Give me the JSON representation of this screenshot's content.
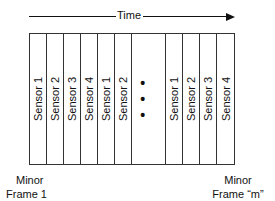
{
  "axis": {
    "label": "Time",
    "direction": "right"
  },
  "frame": {
    "columns": [
      {
        "type": "sensor",
        "label": "Sensor 1"
      },
      {
        "type": "sensor",
        "label": "Sensor 2"
      },
      {
        "type": "sensor",
        "label": "Sensor 3"
      },
      {
        "type": "sensor",
        "label": "Sensor 4"
      },
      {
        "type": "sensor",
        "label": "Sensor 1"
      },
      {
        "type": "sensor",
        "label": "Sensor 2"
      },
      {
        "type": "ellipsis",
        "label": "• • •"
      },
      {
        "type": "sensor",
        "label": "Sensor 1"
      },
      {
        "type": "sensor",
        "label": "Sensor 2"
      },
      {
        "type": "sensor",
        "label": "Sensor 3"
      },
      {
        "type": "sensor",
        "label": "Sensor 4"
      }
    ]
  },
  "captions": {
    "left": [
      "Minor",
      "Frame 1"
    ],
    "right": [
      "Minor",
      "Frame “m”"
    ]
  }
}
